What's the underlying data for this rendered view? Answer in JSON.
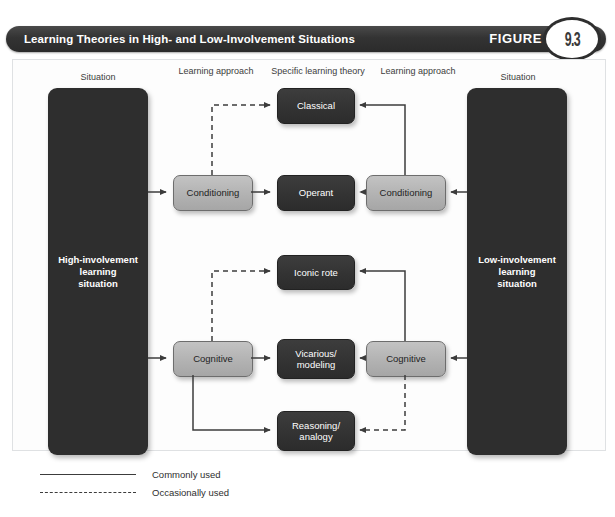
{
  "running_head": {
    "left": "",
    "center": "",
    "right": ""
  },
  "header": {
    "title": "Learning Theories in High- and Low-Involvement Situations",
    "figure_word": "FIGURE",
    "figure_number": "9.3",
    "bar_color": "#333333",
    "badge_text_color": "#3a3a3a"
  },
  "column_headers": [
    {
      "id": "situation-left",
      "text": "Situation"
    },
    {
      "id": "learning-approach-left",
      "text": "Learning\napproach"
    },
    {
      "id": "specific-learning-theory",
      "text": "Specific\nlearning theory"
    },
    {
      "id": "learning-approach-right",
      "text": "Learning\napproach"
    },
    {
      "id": "situation-right",
      "text": "Situation"
    }
  ],
  "situations": {
    "left": {
      "label": "High-involvement\nlearning\nsituation",
      "color": "#2e2e2e"
    },
    "right": {
      "label": "Low-involvement\nlearning\nsituation",
      "color": "#2e2e2e"
    }
  },
  "approaches": {
    "high_conditioning": {
      "label": "Conditioning",
      "color": "#b2b2b2"
    },
    "low_conditioning": {
      "label": "Conditioning",
      "color": "#b2b2b2"
    },
    "high_cognitive": {
      "label": "Cognitive",
      "color": "#b2b2b2"
    },
    "low_cognitive": {
      "label": "Cognitive",
      "color": "#b2b2b2"
    }
  },
  "theories": {
    "classical": {
      "label": "Classical",
      "color": "#333333"
    },
    "operant": {
      "label": "Operant",
      "color": "#333333"
    },
    "iconic_rote": {
      "label": "Iconic rote",
      "color": "#333333"
    },
    "vicarious_modeling": {
      "label": "Vicarious/\nmodeling",
      "color": "#333333"
    },
    "reasoning_analogy": {
      "label": "Reasoning/\nanalogy",
      "color": "#333333"
    }
  },
  "legend": [
    {
      "style": "solid",
      "label": "Commonly used"
    },
    {
      "style": "dashed",
      "label": "Occasionally used"
    }
  ],
  "links": [
    {
      "from": "high-involvement-situation",
      "to": "high-conditioning",
      "style": "solid"
    },
    {
      "from": "high-conditioning",
      "to": "classical",
      "style": "dashed"
    },
    {
      "from": "high-conditioning",
      "to": "operant",
      "style": "solid"
    },
    {
      "from": "low-involvement-situation",
      "to": "low-conditioning",
      "style": "solid"
    },
    {
      "from": "low-conditioning",
      "to": "classical",
      "style": "solid"
    },
    {
      "from": "low-conditioning",
      "to": "operant",
      "style": "dashed"
    },
    {
      "from": "high-involvement-situation",
      "to": "high-cognitive",
      "style": "solid"
    },
    {
      "from": "high-cognitive",
      "to": "iconic-rote",
      "style": "dashed"
    },
    {
      "from": "high-cognitive",
      "to": "vicarious-modeling",
      "style": "solid"
    },
    {
      "from": "high-cognitive",
      "to": "reasoning-analogy",
      "style": "solid"
    },
    {
      "from": "low-involvement-situation",
      "to": "low-cognitive",
      "style": "solid"
    },
    {
      "from": "low-cognitive",
      "to": "iconic-rote",
      "style": "solid"
    },
    {
      "from": "low-cognitive",
      "to": "vicarious-modeling",
      "style": "solid"
    },
    {
      "from": "low-cognitive",
      "to": "reasoning-analogy",
      "style": "dashed"
    }
  ]
}
